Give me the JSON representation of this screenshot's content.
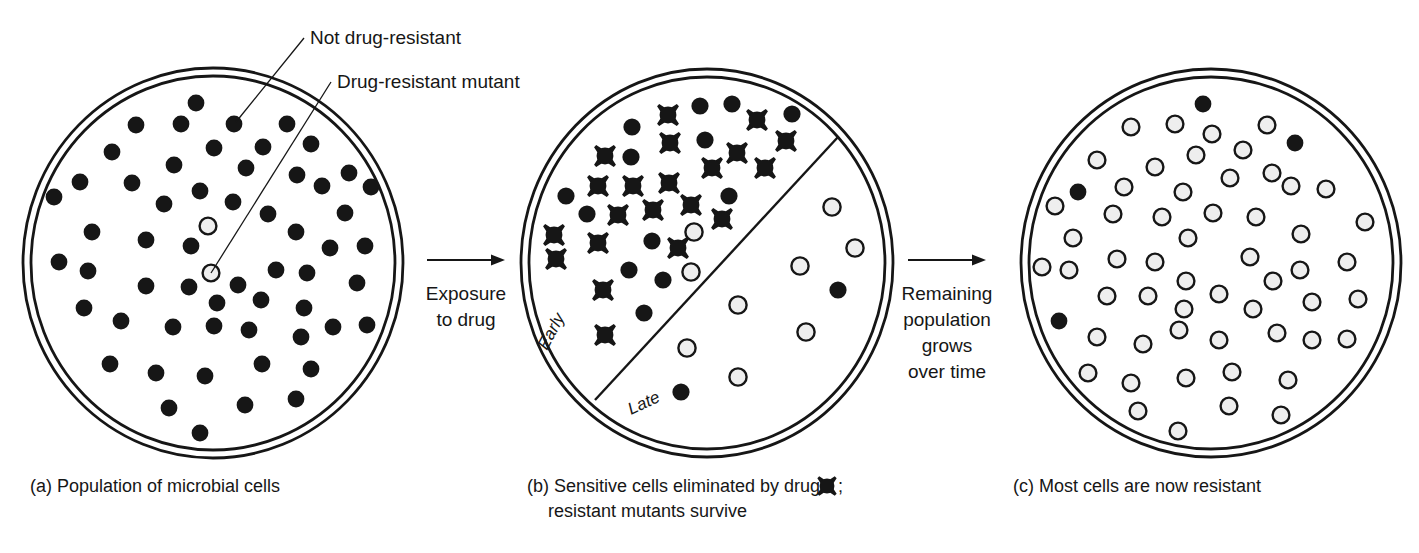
{
  "figure": {
    "colors": {
      "stroke": "#161616",
      "sensitive_fill": "#161616",
      "resistant_fill": "#eeeeee",
      "resistant_stroke": "#161616",
      "background": "#ffffff"
    }
  },
  "callouts": [
    {
      "id": "not-drug-resistant",
      "label": "Not drug-resistant",
      "text_x": 310,
      "text_y": 44,
      "line": [
        304,
        38,
        236,
        122
      ]
    },
    {
      "id": "drug-resistant-mutant",
      "label": "Drug-resistant mutant",
      "text_x": 337,
      "text_y": 88,
      "line": [
        331,
        82,
        211,
        273
      ]
    }
  ],
  "transitions": [
    {
      "id": "exposure-to-drug",
      "lines": [
        "Exposure",
        "to drug"
      ],
      "arrow": {
        "x1": 427,
        "y1": 260,
        "x2": 505,
        "y2": 260
      },
      "text_x": 466,
      "text_y": 300,
      "line_height": 26
    },
    {
      "id": "remaining-population-grows",
      "lines": [
        "Remaining",
        "population",
        "grows",
        "over time"
      ],
      "arrow": {
        "x1": 908,
        "y1": 260,
        "x2": 986,
        "y2": 260
      },
      "text_x": 947,
      "text_y": 300,
      "line_height": 26
    }
  ],
  "dishes": [
    {
      "id": "dish-a",
      "caption": "(a) Population of microbial cells",
      "caption_lines": [
        "(a) Population of microbial cells"
      ],
      "caption_x": 30,
      "caption_y": 492,
      "center": {
        "x": 213,
        "y": 263
      },
      "outer_rx": 190,
      "outer_ry": 195,
      "inner_rx": 182,
      "inner_ry": 187,
      "sectors": [],
      "cells": [
        {
          "type": "sensitive",
          "x": 196,
          "y": 103
        },
        {
          "type": "sensitive",
          "x": 136,
          "y": 125
        },
        {
          "type": "sensitive",
          "x": 181,
          "y": 124
        },
        {
          "type": "sensitive",
          "x": 234,
          "y": 124
        },
        {
          "type": "sensitive",
          "x": 287,
          "y": 124
        },
        {
          "type": "sensitive",
          "x": 214,
          "y": 148
        },
        {
          "type": "sensitive",
          "x": 263,
          "y": 147
        },
        {
          "type": "sensitive",
          "x": 311,
          "y": 144
        },
        {
          "type": "sensitive",
          "x": 112,
          "y": 152
        },
        {
          "type": "sensitive",
          "x": 174,
          "y": 165
        },
        {
          "type": "sensitive",
          "x": 246,
          "y": 168
        },
        {
          "type": "sensitive",
          "x": 297,
          "y": 175
        },
        {
          "type": "sensitive",
          "x": 349,
          "y": 173
        },
        {
          "type": "sensitive",
          "x": 80,
          "y": 182
        },
        {
          "type": "sensitive",
          "x": 132,
          "y": 183
        },
        {
          "type": "sensitive",
          "x": 200,
          "y": 191
        },
        {
          "type": "sensitive",
          "x": 322,
          "y": 186
        },
        {
          "type": "sensitive",
          "x": 371,
          "y": 187
        },
        {
          "type": "sensitive",
          "x": 54,
          "y": 197
        },
        {
          "type": "sensitive",
          "x": 164,
          "y": 204
        },
        {
          "type": "sensitive",
          "x": 233,
          "y": 202
        },
        {
          "type": "sensitive",
          "x": 268,
          "y": 214
        },
        {
          "type": "sensitive",
          "x": 345,
          "y": 213
        },
        {
          "type": "resistant",
          "x": 208,
          "y": 226
        },
        {
          "type": "sensitive",
          "x": 92,
          "y": 232
        },
        {
          "type": "sensitive",
          "x": 146,
          "y": 240
        },
        {
          "type": "sensitive",
          "x": 191,
          "y": 246
        },
        {
          "type": "sensitive",
          "x": 296,
          "y": 232
        },
        {
          "type": "sensitive",
          "x": 330,
          "y": 248
        },
        {
          "type": "sensitive",
          "x": 365,
          "y": 246
        },
        {
          "type": "resistant",
          "x": 211,
          "y": 273
        },
        {
          "type": "sensitive",
          "x": 59,
          "y": 262
        },
        {
          "type": "sensitive",
          "x": 88,
          "y": 271
        },
        {
          "type": "sensitive",
          "x": 146,
          "y": 286
        },
        {
          "type": "sensitive",
          "x": 189,
          "y": 287
        },
        {
          "type": "sensitive",
          "x": 238,
          "y": 285
        },
        {
          "type": "sensitive",
          "x": 276,
          "y": 270
        },
        {
          "type": "sensitive",
          "x": 307,
          "y": 273
        },
        {
          "type": "sensitive",
          "x": 357,
          "y": 283
        },
        {
          "type": "sensitive",
          "x": 217,
          "y": 303
        },
        {
          "type": "sensitive",
          "x": 261,
          "y": 300
        },
        {
          "type": "sensitive",
          "x": 304,
          "y": 308
        },
        {
          "type": "sensitive",
          "x": 84,
          "y": 308
        },
        {
          "type": "sensitive",
          "x": 121,
          "y": 321
        },
        {
          "type": "sensitive",
          "x": 173,
          "y": 327
        },
        {
          "type": "sensitive",
          "x": 214,
          "y": 326
        },
        {
          "type": "sensitive",
          "x": 249,
          "y": 330
        },
        {
          "type": "sensitive",
          "x": 333,
          "y": 327
        },
        {
          "type": "sensitive",
          "x": 301,
          "y": 337
        },
        {
          "type": "sensitive",
          "x": 367,
          "y": 325
        },
        {
          "type": "sensitive",
          "x": 110,
          "y": 364
        },
        {
          "type": "sensitive",
          "x": 156,
          "y": 373
        },
        {
          "type": "sensitive",
          "x": 205,
          "y": 376
        },
        {
          "type": "sensitive",
          "x": 262,
          "y": 364
        },
        {
          "type": "sensitive",
          "x": 311,
          "y": 369
        },
        {
          "type": "sensitive",
          "x": 169,
          "y": 408
        },
        {
          "type": "sensitive",
          "x": 245,
          "y": 405
        },
        {
          "type": "sensitive",
          "x": 296,
          "y": 399
        },
        {
          "type": "sensitive",
          "x": 200,
          "y": 433
        }
      ]
    },
    {
      "id": "dish-b",
      "caption": "(b) Sensitive cells eliminated by drug ✖ ; resistant mutants survive",
      "caption_lines": [
        "(b) Sensitive cells eliminated by drug ",
        "; ",
        "resistant mutants survive"
      ],
      "caption_x": 527,
      "caption_y": 492,
      "center": {
        "x": 707,
        "y": 263
      },
      "outer_rx": 186,
      "outer_ry": 194,
      "inner_rx": 178,
      "inner_ry": 186,
      "sectors": [
        {
          "label": "Early",
          "x": 556,
          "y": 334,
          "rotate": -62
        },
        {
          "label": "Late",
          "x": 646,
          "y": 408,
          "rotate": -25
        }
      ],
      "divider": {
        "x1": 595,
        "y1": 400,
        "x2": 838,
        "y2": 137
      },
      "cells": [
        {
          "type": "killed",
          "x": 668,
          "y": 115
        },
        {
          "type": "sensitive",
          "x": 700,
          "y": 106
        },
        {
          "type": "sensitive",
          "x": 732,
          "y": 104
        },
        {
          "type": "killed",
          "x": 757,
          "y": 120
        },
        {
          "type": "sensitive",
          "x": 792,
          "y": 114
        },
        {
          "type": "sensitive",
          "x": 632,
          "y": 127
        },
        {
          "type": "killed",
          "x": 670,
          "y": 143
        },
        {
          "type": "sensitive",
          "x": 705,
          "y": 140
        },
        {
          "type": "killed",
          "x": 737,
          "y": 153
        },
        {
          "type": "killed",
          "x": 786,
          "y": 141
        },
        {
          "type": "killed",
          "x": 605,
          "y": 156
        },
        {
          "type": "sensitive",
          "x": 631,
          "y": 157
        },
        {
          "type": "killed",
          "x": 712,
          "y": 168
        },
        {
          "type": "killed",
          "x": 765,
          "y": 168
        },
        {
          "type": "killed",
          "x": 598,
          "y": 186
        },
        {
          "type": "killed",
          "x": 633,
          "y": 186
        },
        {
          "type": "killed",
          "x": 669,
          "y": 183
        },
        {
          "type": "sensitive",
          "x": 566,
          "y": 196
        },
        {
          "type": "killed",
          "x": 691,
          "y": 205
        },
        {
          "type": "sensitive",
          "x": 729,
          "y": 196
        },
        {
          "type": "sensitive",
          "x": 587,
          "y": 214
        },
        {
          "type": "killed",
          "x": 618,
          "y": 215
        },
        {
          "type": "killed",
          "x": 653,
          "y": 210
        },
        {
          "type": "killed",
          "x": 722,
          "y": 219
        },
        {
          "type": "killed",
          "x": 554,
          "y": 235
        },
        {
          "type": "resistant",
          "x": 694,
          "y": 232
        },
        {
          "type": "killed",
          "x": 598,
          "y": 243
        },
        {
          "type": "sensitive",
          "x": 652,
          "y": 241
        },
        {
          "type": "killed",
          "x": 678,
          "y": 248
        },
        {
          "type": "killed",
          "x": 556,
          "y": 259
        },
        {
          "type": "sensitive",
          "x": 629,
          "y": 270
        },
        {
          "type": "resistant",
          "x": 691,
          "y": 272
        },
        {
          "type": "sensitive",
          "x": 663,
          "y": 280
        },
        {
          "type": "killed",
          "x": 603,
          "y": 290
        },
        {
          "type": "sensitive",
          "x": 644,
          "y": 313
        },
        {
          "type": "killed",
          "x": 605,
          "y": 335
        },
        {
          "type": "resistant",
          "x": 832,
          "y": 207
        },
        {
          "type": "resistant",
          "x": 855,
          "y": 248
        },
        {
          "type": "resistant",
          "x": 800,
          "y": 266
        },
        {
          "type": "sensitive",
          "x": 838,
          "y": 290
        },
        {
          "type": "resistant",
          "x": 738,
          "y": 305
        },
        {
          "type": "resistant",
          "x": 806,
          "y": 332
        },
        {
          "type": "resistant",
          "x": 687,
          "y": 348
        },
        {
          "type": "resistant",
          "x": 738,
          "y": 377
        },
        {
          "type": "sensitive",
          "x": 681,
          "y": 392
        }
      ]
    },
    {
      "id": "dish-c",
      "caption": "(c) Most cells are now resistant",
      "caption_lines": [
        "(c) Most cells are now resistant"
      ],
      "caption_x": 1013,
      "caption_y": 492,
      "center": {
        "x": 1211,
        "y": 263
      },
      "outer_rx": 190,
      "outer_ry": 194,
      "inner_rx": 182,
      "inner_ry": 186,
      "sectors": [],
      "cells": [
        {
          "type": "sensitive",
          "x": 1203,
          "y": 104
        },
        {
          "type": "resistant",
          "x": 1131,
          "y": 127
        },
        {
          "type": "resistant",
          "x": 1175,
          "y": 124
        },
        {
          "type": "resistant",
          "x": 1212,
          "y": 134
        },
        {
          "type": "resistant",
          "x": 1267,
          "y": 125
        },
        {
          "type": "sensitive",
          "x": 1295,
          "y": 143
        },
        {
          "type": "resistant",
          "x": 1196,
          "y": 155
        },
        {
          "type": "resistant",
          "x": 1243,
          "y": 150
        },
        {
          "type": "resistant",
          "x": 1097,
          "y": 160
        },
        {
          "type": "resistant",
          "x": 1155,
          "y": 167
        },
        {
          "type": "resistant",
          "x": 1230,
          "y": 178
        },
        {
          "type": "resistant",
          "x": 1272,
          "y": 173
        },
        {
          "type": "sensitive",
          "x": 1078,
          "y": 192
        },
        {
          "type": "resistant",
          "x": 1124,
          "y": 187
        },
        {
          "type": "resistant",
          "x": 1183,
          "y": 192
        },
        {
          "type": "resistant",
          "x": 1291,
          "y": 186
        },
        {
          "type": "resistant",
          "x": 1326,
          "y": 189
        },
        {
          "type": "resistant",
          "x": 1055,
          "y": 206
        },
        {
          "type": "resistant",
          "x": 1113,
          "y": 214
        },
        {
          "type": "resistant",
          "x": 1162,
          "y": 217
        },
        {
          "type": "resistant",
          "x": 1213,
          "y": 213
        },
        {
          "type": "resistant",
          "x": 1256,
          "y": 217
        },
        {
          "type": "resistant",
          "x": 1301,
          "y": 234
        },
        {
          "type": "resistant",
          "x": 1365,
          "y": 222
        },
        {
          "type": "resistant",
          "x": 1073,
          "y": 238
        },
        {
          "type": "resistant",
          "x": 1188,
          "y": 238
        },
        {
          "type": "resistant",
          "x": 1042,
          "y": 267
        },
        {
          "type": "resistant",
          "x": 1069,
          "y": 270
        },
        {
          "type": "resistant",
          "x": 1117,
          "y": 259
        },
        {
          "type": "resistant",
          "x": 1155,
          "y": 262
        },
        {
          "type": "resistant",
          "x": 1250,
          "y": 257
        },
        {
          "type": "resistant",
          "x": 1300,
          "y": 270
        },
        {
          "type": "resistant",
          "x": 1347,
          "y": 262
        },
        {
          "type": "resistant",
          "x": 1186,
          "y": 281
        },
        {
          "type": "resistant",
          "x": 1107,
          "y": 296
        },
        {
          "type": "resistant",
          "x": 1148,
          "y": 296
        },
        {
          "type": "resistant",
          "x": 1219,
          "y": 294
        },
        {
          "type": "resistant",
          "x": 1273,
          "y": 281
        },
        {
          "type": "resistant",
          "x": 1184,
          "y": 309
        },
        {
          "type": "resistant",
          "x": 1253,
          "y": 309
        },
        {
          "type": "resistant",
          "x": 1312,
          "y": 302
        },
        {
          "type": "sensitive",
          "x": 1059,
          "y": 321
        },
        {
          "type": "resistant",
          "x": 1358,
          "y": 299
        },
        {
          "type": "resistant",
          "x": 1179,
          "y": 330
        },
        {
          "type": "resistant",
          "x": 1097,
          "y": 337
        },
        {
          "type": "resistant",
          "x": 1143,
          "y": 344
        },
        {
          "type": "resistant",
          "x": 1219,
          "y": 340
        },
        {
          "type": "resistant",
          "x": 1277,
          "y": 333
        },
        {
          "type": "resistant",
          "x": 1312,
          "y": 340
        },
        {
          "type": "resistant",
          "x": 1347,
          "y": 339
        },
        {
          "type": "resistant",
          "x": 1088,
          "y": 373
        },
        {
          "type": "resistant",
          "x": 1131,
          "y": 383
        },
        {
          "type": "resistant",
          "x": 1186,
          "y": 378
        },
        {
          "type": "resistant",
          "x": 1232,
          "y": 372
        },
        {
          "type": "resistant",
          "x": 1288,
          "y": 380
        },
        {
          "type": "resistant",
          "x": 1138,
          "y": 411
        },
        {
          "type": "resistant",
          "x": 1229,
          "y": 406
        },
        {
          "type": "resistant",
          "x": 1281,
          "y": 415
        },
        {
          "type": "resistant",
          "x": 1178,
          "y": 431
        }
      ]
    }
  ],
  "legend": {
    "killed_glyph_name": "killed-cell-icon",
    "sensitive_name": "sensitive-cell",
    "resistant_name": "resistant-cell"
  }
}
